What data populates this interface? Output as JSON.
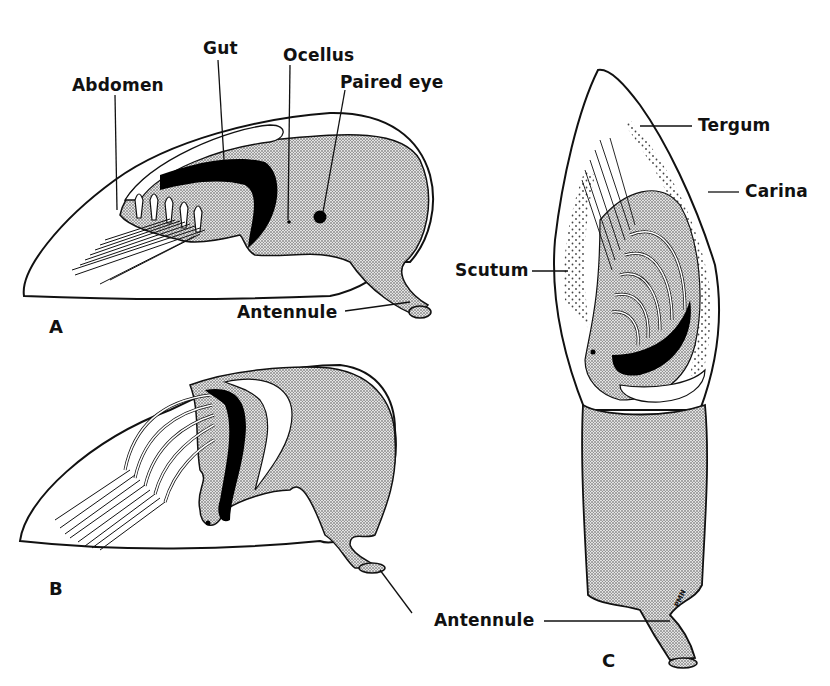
{
  "figure": {
    "panels": [
      {
        "id": "A",
        "label": "A"
      },
      {
        "id": "B",
        "label": "B"
      },
      {
        "id": "C",
        "label": "C"
      }
    ],
    "labels": {
      "abdomen": "Abdomen",
      "gut": "Gut",
      "ocellus": "Ocellus",
      "paired_eye": "Paired eye",
      "antennule_a": "Antennule",
      "tergum": "Tergum",
      "carina": "Carina",
      "scutum": "Scutum",
      "antennule_bc": "Antennule"
    },
    "signature": "PMN",
    "colors": {
      "ink": "#111111",
      "paper": "#ffffff",
      "stipple": "#888888"
    }
  }
}
